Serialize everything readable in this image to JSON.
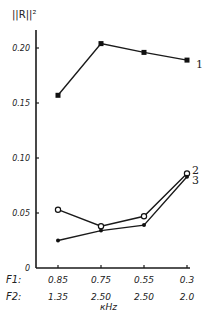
{
  "chart_data": {
    "type": "line",
    "title": "",
    "ylabel": "||R||²",
    "xlabel": "кHz",
    "ylim": [
      0,
      0.22
    ],
    "yticks": [
      0,
      0.05,
      0.1,
      0.15,
      0.2
    ],
    "ytick_labels": [
      "0",
      "0.05",
      "0.10",
      "0.15",
      "0.20"
    ],
    "grid": false,
    "x_rows": [
      {
        "name": "F1:",
        "labels": [
          "0.85",
          "0.75",
          "0.55",
          "0.3"
        ]
      },
      {
        "name": "F2:",
        "labels": [
          "1.35",
          "2.50",
          "2.50",
          "2.0"
        ]
      }
    ],
    "categories": [
      "0.85/1.35",
      "0.75/2.50",
      "0.55/2.50",
      "0.3/2.0"
    ],
    "series": [
      {
        "name": "1",
        "marker": "square",
        "values": [
          0.157,
          0.204,
          0.196,
          0.189
        ]
      },
      {
        "name": "2",
        "marker": "open-circle",
        "values": [
          0.053,
          0.038,
          0.047,
          0.086
        ]
      },
      {
        "name": "3",
        "marker": "dot",
        "values": [
          0.025,
          0.034,
          0.039,
          0.083
        ]
      }
    ]
  }
}
